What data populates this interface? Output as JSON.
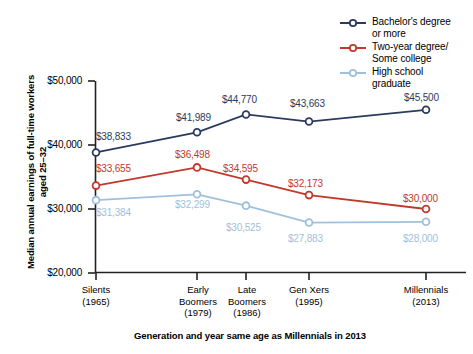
{
  "chart_data": {
    "type": "line",
    "title": "",
    "xlabel": "Generation and year same age as Millennials in 2013",
    "ylabel": "Median annual earnings of full-time workers aged 25–32",
    "categories": [
      "Silents\n(1965)",
      "Early\nBoomers\n(1979)",
      "Late\nBoomers\n(1986)",
      "Gen Xers\n(1995)",
      "Millennials\n(2013)"
    ],
    "ylim": [
      20000,
      50000
    ],
    "ytick_labels": [
      "$50,000",
      "$40,000",
      "$30,000",
      "$20,000"
    ],
    "ytick_values": [
      50000,
      40000,
      30000,
      20000
    ],
    "grid": false,
    "legend_position": "top-right",
    "series": [
      {
        "name": "Bachelor's degree\nor more",
        "color": "#2b3a5e",
        "values": [
          38833,
          41989,
          44770,
          43663,
          45500
        ],
        "labels": [
          "$38,833",
          "$41,989",
          "$44,770",
          "$43,663",
          "$45,500"
        ]
      },
      {
        "name": "Two-year degree/\nSome college",
        "color": "#c0392b",
        "values": [
          33655,
          36498,
          34595,
          32173,
          30000
        ],
        "labels": [
          "$33,655",
          "$36,498",
          "$34,595",
          "$32,173",
          "$30,000"
        ]
      },
      {
        "name": "High school\ngraduate",
        "color": "#9fc0dc",
        "values": [
          31384,
          32299,
          30525,
          27883,
          28000
        ],
        "labels": [
          "$31,384",
          "$32,299",
          "$30,525",
          "$27,883",
          "$28,000"
        ]
      }
    ]
  }
}
